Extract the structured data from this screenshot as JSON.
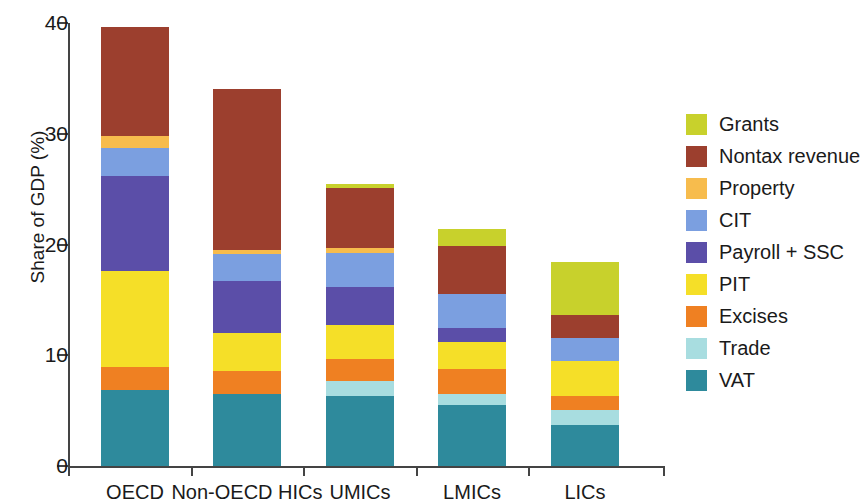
{
  "chart_data": {
    "type": "bar",
    "subtype": "stacked-bar",
    "title": "",
    "xlabel": "",
    "ylabel": "Share of GDP (%)",
    "ylim": [
      0,
      40
    ],
    "yticks": [
      0,
      10,
      20,
      30,
      40
    ],
    "ytick_labels": [
      "0",
      "10",
      "20",
      "30",
      "40"
    ],
    "grid": false,
    "legend_position": "right",
    "categories": [
      "OECD",
      "Non-OECD HICs",
      "UMICs",
      "LMICs",
      "LICs"
    ],
    "series": [
      {
        "name": "VAT",
        "color": "#2e8a9c",
        "values": [
          6.9,
          6.5,
          6.3,
          5.5,
          3.7
        ]
      },
      {
        "name": "Trade",
        "color": "#a8dde0",
        "values": [
          0.0,
          0.0,
          1.4,
          1.0,
          1.4
        ]
      },
      {
        "name": "Excises",
        "color": "#ef8022",
        "values": [
          2.0,
          2.1,
          2.0,
          2.3,
          1.2
        ]
      },
      {
        "name": "PIT",
        "color": "#f5df28",
        "values": [
          8.7,
          3.4,
          3.0,
          2.4,
          3.2
        ]
      },
      {
        "name": "Payroll + SSC",
        "color": "#5b4ea8",
        "values": [
          8.6,
          4.7,
          3.5,
          1.3,
          0.0
        ]
      },
      {
        "name": "CIT",
        "color": "#7b9fe0",
        "values": [
          2.5,
          2.4,
          3.0,
          3.0,
          2.1
        ]
      },
      {
        "name": "Property",
        "color": "#f7bc4d",
        "values": [
          1.1,
          0.4,
          0.5,
          0.0,
          0.0
        ]
      },
      {
        "name": "Nontax revenue",
        "color": "#9c3f2e",
        "values": [
          9.8,
          14.5,
          5.4,
          4.4,
          2.0
        ]
      },
      {
        "name": "Grants",
        "color": "#c8d12c",
        "values": [
          0.0,
          0.0,
          0.4,
          1.5,
          4.8
        ]
      }
    ],
    "totals": [
      39.6,
      34.0,
      25.6,
      21.5,
      18.3
    ],
    "legend_order": [
      "Grants",
      "Nontax revenue",
      "Property",
      "CIT",
      "Payroll + SSC",
      "PIT",
      "Excises",
      "Trade",
      "VAT"
    ]
  },
  "axis": {
    "y_title": "Share of GDP (%)",
    "y_tick_labels": [
      "40",
      "30",
      "20",
      "10",
      "0"
    ],
    "x_tick_labels": [
      "OECD",
      "Non-OECD HICs",
      "UMICs",
      "LMICs",
      "LICs"
    ]
  },
  "legend": {
    "items": [
      {
        "label": "Grants",
        "color": "#c8d12c"
      },
      {
        "label": "Nontax revenue",
        "color": "#9c3f2e"
      },
      {
        "label": "Property",
        "color": "#f7bc4d"
      },
      {
        "label": "CIT",
        "color": "#7b9fe0"
      },
      {
        "label": "Payroll + SSC",
        "color": "#5b4ea8"
      },
      {
        "label": "PIT",
        "color": "#f5df28"
      },
      {
        "label": "Excises",
        "color": "#ef8022"
      },
      {
        "label": "Trade",
        "color": "#a8dde0"
      },
      {
        "label": "VAT",
        "color": "#2e8a9c"
      }
    ]
  },
  "style": {
    "axis_color": "#444444",
    "background": "#ffffff"
  }
}
